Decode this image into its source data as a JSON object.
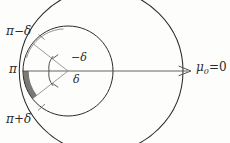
{
  "figure": {
    "type": "geometric-diagram",
    "background_color": "#fdfdfc",
    "ink_color": "#2b2b2b",
    "shade_color": "#6d6a66"
  },
  "labels": {
    "pi_minus_delta": "π−δ",
    "pi": "π",
    "pi_plus_delta": "π+δ",
    "neg_delta": "−δ",
    "delta": "δ",
    "mu_symbol": "μ",
    "mu_subscript": "0",
    "mu_equals": "=",
    "mu_value": "0"
  },
  "geometry": {
    "outer_circle": {
      "cx": 101,
      "cy": 71,
      "r": 82
    },
    "middle_circle": {
      "cx": 68,
      "cy": 71,
      "r": 45
    },
    "angle_arc_upper_r": 19,
    "angle_arc_lower_r": 19,
    "axis": {
      "x1": 22,
      "y1": 71,
      "x2": 190,
      "y2": 71
    },
    "delta_degrees": 38
  }
}
